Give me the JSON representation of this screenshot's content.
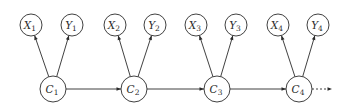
{
  "diagram": {
    "type": "dynamic-bayesian-network",
    "colors": {
      "stroke": "#2b2b2b",
      "fill": "#ffffff"
    },
    "nodes": [
      {
        "id": "X1",
        "letter": "X",
        "sub": "1",
        "x": 31,
        "y": 25,
        "r": 11
      },
      {
        "id": "Y1",
        "letter": "Y",
        "sub": "1",
        "x": 72,
        "y": 25,
        "r": 11
      },
      {
        "id": "C1",
        "letter": "C",
        "sub": "1",
        "x": 53,
        "y": 89,
        "r": 13
      },
      {
        "id": "X2",
        "letter": "X",
        "sub": "2",
        "x": 115,
        "y": 25,
        "r": 11
      },
      {
        "id": "Y2",
        "letter": "Y",
        "sub": "2",
        "x": 155,
        "y": 25,
        "r": 11
      },
      {
        "id": "C2",
        "letter": "C",
        "sub": "2",
        "x": 134,
        "y": 89,
        "r": 13
      },
      {
        "id": "X3",
        "letter": "X",
        "sub": "3",
        "x": 196,
        "y": 25,
        "r": 11
      },
      {
        "id": "Y3",
        "letter": "Y",
        "sub": "3",
        "x": 236,
        "y": 25,
        "r": 11
      },
      {
        "id": "C3",
        "letter": "C",
        "sub": "3",
        "x": 217,
        "y": 89,
        "r": 13
      },
      {
        "id": "X4",
        "letter": "X",
        "sub": "4",
        "x": 278,
        "y": 25,
        "r": 11
      },
      {
        "id": "Y4",
        "letter": "Y",
        "sub": "4",
        "x": 318,
        "y": 25,
        "r": 11
      },
      {
        "id": "C4",
        "letter": "C",
        "sub": "4",
        "x": 299,
        "y": 89,
        "r": 13
      }
    ],
    "edges": [
      {
        "from": "C1",
        "to": "X1"
      },
      {
        "from": "C1",
        "to": "Y1"
      },
      {
        "from": "C1",
        "to": "C2"
      },
      {
        "from": "C2",
        "to": "X2"
      },
      {
        "from": "C2",
        "to": "Y2"
      },
      {
        "from": "C2",
        "to": "C3"
      },
      {
        "from": "C3",
        "to": "X3"
      },
      {
        "from": "C3",
        "to": "Y3"
      },
      {
        "from": "C3",
        "to": "C4"
      },
      {
        "from": "C4",
        "to": "X4"
      },
      {
        "from": "C4",
        "to": "Y4"
      },
      {
        "from": "C4",
        "to": "continuation",
        "style": "dotted",
        "end": {
          "x": 332,
          "y": 89
        }
      }
    ]
  }
}
